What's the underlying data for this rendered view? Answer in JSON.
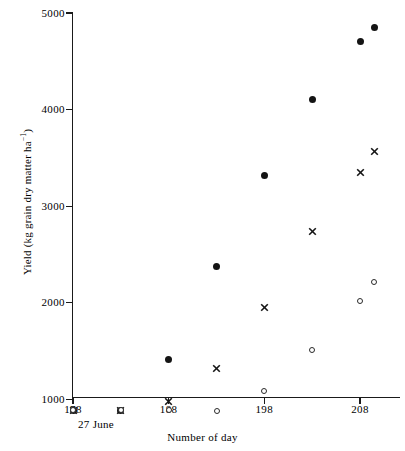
{
  "chart_data": {
    "type": "scatter",
    "title": "",
    "xlabel": "Number of day",
    "ylabel": "Yield (kg grain dry matter ha−1)",
    "ylabel_base": "Yield (kg grain dry matter ha",
    "ylabel_exponent": "−1",
    "ylabel_close": ")",
    "x_sub_annotation": "27 June",
    "xlim": [
      176,
      212
    ],
    "ylim": [
      830,
      5000
    ],
    "grid": false,
    "legend": "none",
    "xticks": [
      178,
      188,
      198,
      208
    ],
    "xtick_labels": [
      "178",
      "188",
      "198",
      "208"
    ],
    "yticks": [
      1000,
      2000,
      3000,
      4000,
      5000
    ],
    "ytick_labels": [
      "1000",
      "2000",
      "3000",
      "4000",
      "5000"
    ],
    "series": [
      {
        "name": "filled-circle",
        "marker": "filled-circle",
        "color": "#141414",
        "x": [
          178,
          183,
          188,
          193,
          198,
          203,
          208,
          209.5
        ],
        "values": [
          890,
          890,
          1410,
          2375,
          3320,
          4105,
          4700,
          4850
        ]
      },
      {
        "name": "cross",
        "marker": "cross",
        "color": "#141414",
        "x": [
          178,
          183,
          188,
          193,
          198,
          203,
          208,
          209.5
        ],
        "values": [
          890,
          890,
          975,
          1320,
          1955,
          2735,
          3350,
          3570
        ]
      },
      {
        "name": "open-circle",
        "marker": "open-circle",
        "color": "#2a2a2a",
        "x": [
          178,
          183,
          188,
          193,
          198,
          203,
          208,
          209.5
        ],
        "values": [
          890,
          890,
          890,
          885,
          1085,
          1510,
          2015,
          2220
        ]
      }
    ]
  }
}
